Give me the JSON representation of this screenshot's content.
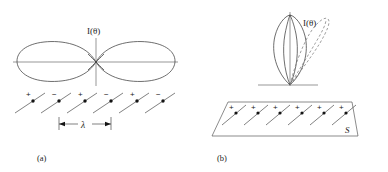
{
  "figure": {
    "caption_a": "(a)",
    "caption_b": "(b)",
    "panel_a": {
      "intensity_label": "I(θ)",
      "spacing_label": "λ",
      "dipole_signs": [
        "+",
        "−",
        "+",
        "−",
        "+",
        "−"
      ],
      "dipole_count": 6,
      "pattern_type": "figure-eight broadside-null (end-fire) radiation lobes",
      "lobes": 2
    },
    "panel_b": {
      "intensity_label": "I(θ)",
      "surface_label": "S",
      "dipole_signs": [
        "+",
        "+",
        "+",
        "+",
        "+",
        "+"
      ],
      "dipole_count": 6,
      "pattern_type": "single narrow vertical lobe with dashed tilted lobe",
      "solid_lobe": "vertical main lobe",
      "dashed_lobe": "tilted (steered) lobe"
    },
    "colors": {
      "ink": "#1c1c1c",
      "line": "#3d3d3d",
      "axis": "#6a6a6a",
      "dashed": "#7d7d7d",
      "background": "#ffffff"
    }
  }
}
